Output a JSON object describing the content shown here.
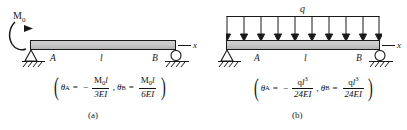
{
  "figure": {
    "panels": [
      {
        "id": "a",
        "caption": "(a)",
        "load": {
          "type": "moment",
          "symbol": "M",
          "subscript": "0",
          "icon": "curved-moment-arrow"
        },
        "beam": {
          "left_support": "pin",
          "right_support": "roller",
          "label_left": "A",
          "label_right": "B",
          "span_label": "l",
          "axis_label": "x"
        },
        "formula": {
          "theta_a_symbol": "θ",
          "theta_a_sub": "A",
          "theta_a_sign": "−",
          "theta_a_num": "M",
          "theta_a_num_sub": "0",
          "theta_a_num_var": "l",
          "theta_a_den": "3EI",
          "theta_b_symbol": "θ",
          "theta_b_sub": "B",
          "theta_b_num": "M",
          "theta_b_num_sub": "0",
          "theta_b_num_var": "l",
          "theta_b_den": "6EI",
          "equals": "=",
          "comma": ","
        }
      },
      {
        "id": "b",
        "caption": "(b)",
        "load": {
          "type": "distributed",
          "symbol": "q",
          "arrow_count": 10,
          "icon": "down-arrow"
        },
        "beam": {
          "left_support": "pin",
          "right_support": "roller",
          "label_left": "A",
          "label_right": "B",
          "span_label": "l",
          "axis_label": "x"
        },
        "formula": {
          "theta_a_symbol": "θ",
          "theta_a_sub": "A",
          "theta_a_sign": "−",
          "theta_a_num": "q",
          "theta_a_num_var": "l",
          "theta_a_num_exp": "3",
          "theta_a_den": "24EI",
          "theta_b_symbol": "θ",
          "theta_b_sub": "B",
          "theta_b_num": "q",
          "theta_b_num_var": "l",
          "theta_b_num_exp": "3",
          "theta_b_den": "24EI",
          "equals": "=",
          "comma": ","
        }
      }
    ],
    "colors": {
      "beam_fill": "#c9c9c9",
      "stroke": "#1a1a1a",
      "background": "#ffffff"
    }
  }
}
